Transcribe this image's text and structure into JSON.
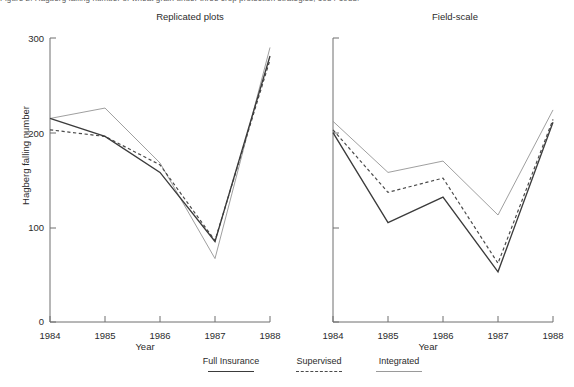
{
  "figure": {
    "caption_sliver": "Figure 2.  Hagberg falling number of wheat grain under three crop protection strategies, 1984-1988.",
    "background_color": "#ffffff"
  },
  "legend": {
    "position": "bottom-center",
    "entries": [
      {
        "label": "Full Insurance",
        "style": "solid",
        "color": "#3b3b3b"
      },
      {
        "label": "Supervised",
        "style": "dashed",
        "color": "#4a4a4a"
      },
      {
        "label": "Integrated",
        "style": "thin-solid",
        "color": "#9a9a9a"
      }
    ]
  },
  "axes": {
    "ylabel": "Hagberg falling number",
    "xlabel": "Year",
    "yticks": [
      "0",
      "100",
      "200",
      "300"
    ],
    "xticks": [
      "1984",
      "1985",
      "1986",
      "1987",
      "1988"
    ]
  },
  "panels": [
    {
      "title": "Replicated plots"
    },
    {
      "title": "Field-scale"
    }
  ],
  "chart_data": [
    {
      "type": "line",
      "title": "Replicated plots",
      "xlabel": "Year",
      "ylabel": "Hagberg falling number",
      "categories": [
        "1984",
        "1985",
        "1986",
        "1987",
        "1988"
      ],
      "x": [
        1984,
        1985,
        1986,
        1987,
        1988
      ],
      "xlim": [
        1984,
        1988
      ],
      "ylim": [
        0,
        300
      ],
      "yticks": [
        0,
        100,
        200,
        300
      ],
      "grid": false,
      "legend_position": "bottom-center",
      "series": [
        {
          "name": "Full Insurance",
          "style": "solid",
          "values": [
            215,
            196,
            158,
            85,
            281
          ]
        },
        {
          "name": "Supervised",
          "style": "dashed",
          "values": [
            203,
            196,
            166,
            86,
            277
          ]
        },
        {
          "name": "Integrated",
          "style": "thin-solid",
          "values": [
            215,
            226,
            168,
            67,
            290
          ]
        }
      ]
    },
    {
      "type": "line",
      "title": "Field-scale",
      "xlabel": "Year",
      "ylabel": "Hagberg falling number",
      "categories": [
        "1984",
        "1985",
        "1986",
        "1987",
        "1988"
      ],
      "x": [
        1984,
        1985,
        1986,
        1987,
        1988
      ],
      "xlim": [
        1984,
        1988
      ],
      "ylim": [
        0,
        300
      ],
      "yticks": [
        0,
        100,
        200,
        300
      ],
      "grid": false,
      "legend_position": "bottom-center",
      "series": [
        {
          "name": "Full Insurance",
          "style": "solid",
          "values": [
            200,
            105,
            132,
            53,
            211
          ]
        },
        {
          "name": "Supervised",
          "style": "dashed",
          "values": [
            203,
            137,
            152,
            62,
            214
          ]
        },
        {
          "name": "Integrated",
          "style": "thin-solid",
          "values": [
            212,
            158,
            170,
            113,
            224
          ]
        }
      ]
    }
  ]
}
